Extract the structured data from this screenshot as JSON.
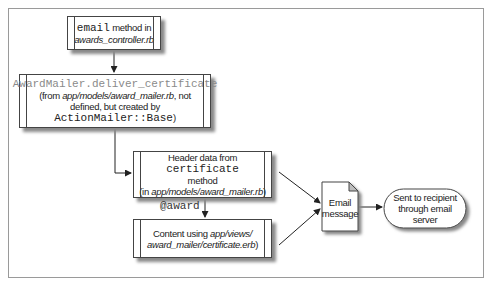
{
  "diagram": {
    "nodes": {
      "email_method": {
        "code": "email",
        "text": " method in",
        "file": "awards_controller.rb"
      },
      "deliver": {
        "code": "AwardMailer.deliver_certificate",
        "line1_pre": "(from ",
        "line1_file": "app/models/award_mailer.rb",
        "line1_post": ", not",
        "line2": "defined, but created by",
        "line3_code": "ActionMailer::Base",
        "line3_post": ")"
      },
      "header": {
        "pre": "Header data from ",
        "code": "certificate",
        "line2": "method",
        "line3_pre": "(in ",
        "line3_file": "app/models/award_mailer.rb",
        "line3_post": ")"
      },
      "content": {
        "pre": "Content using ",
        "file1": "app/views/",
        "file2": "award_mailer/certificate.erb",
        "post": ")"
      },
      "email_message": {
        "line1": "Email",
        "line2": "message"
      },
      "sent": {
        "line1": "Sent to recipient",
        "line2": "through email",
        "line3": "server"
      }
    },
    "edge_labels": {
      "award": "@award"
    },
    "colors": {
      "stroke": "#444444",
      "shadow": "#8a8a8a",
      "code_gray": "#8a8a8a",
      "fold": "#bdbdbd"
    }
  }
}
